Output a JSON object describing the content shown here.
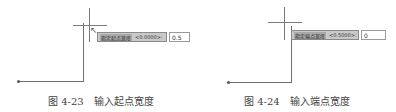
{
  "figures": [
    {
      "prompt_label": "指定起点宽度",
      "default_value": "<0.0000>:",
      "input_value": "0.5",
      "caption_number": "图 4-23",
      "caption_text": "输入起点宽度"
    },
    {
      "prompt_label": "指定端点宽度",
      "default_value": "<0.5000>:",
      "input_value": "0",
      "caption_number": "图 4-24",
      "caption_text": "输入端点宽度"
    }
  ],
  "icons": {
    "cursor": "↖"
  }
}
